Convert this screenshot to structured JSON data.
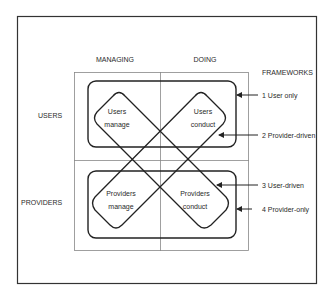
{
  "columns": {
    "managing": "MANAGING",
    "doing": "DOING"
  },
  "rows": {
    "users": "USERS",
    "providers": "PROVIDERS"
  },
  "frameworks_title": "FRAMEWORKS",
  "cells": {
    "users_manage": [
      "Users",
      "manage"
    ],
    "users_conduct": [
      "Users",
      "conduct"
    ],
    "providers_manage": [
      "Providers",
      "manage"
    ],
    "providers_conduct": [
      "Providers",
      "conduct"
    ]
  },
  "frameworks": [
    {
      "label": "1 User only"
    },
    {
      "label": "2 Provider-driven"
    },
    {
      "label": "3 User-driven"
    },
    {
      "label": "4 Provider-only"
    }
  ],
  "colors": {
    "line": "#222222",
    "grid": "#777777",
    "text": "#2a2a2a"
  }
}
